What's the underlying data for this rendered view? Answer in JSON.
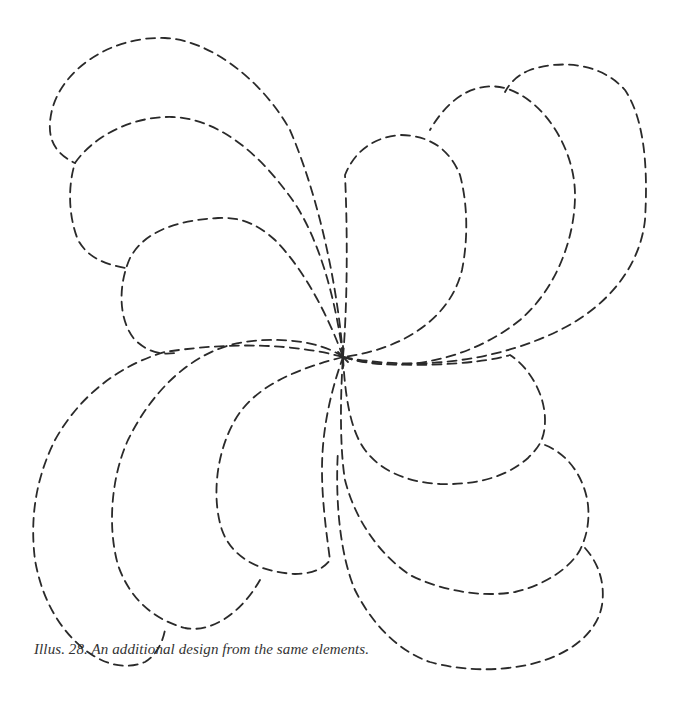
{
  "figure": {
    "caption": "Illus. 28. An additional design from the same elements.",
    "line_color": "#2a2a2a",
    "background": "#ffffff",
    "center": [
      343,
      357
    ],
    "groups": [
      {
        "name": "top-left",
        "petal_count": 3
      },
      {
        "name": "top-right",
        "petal_count": 3
      },
      {
        "name": "bottom-right",
        "petal_count": 3
      },
      {
        "name": "bottom-left",
        "petal_count": 3
      }
    ]
  }
}
